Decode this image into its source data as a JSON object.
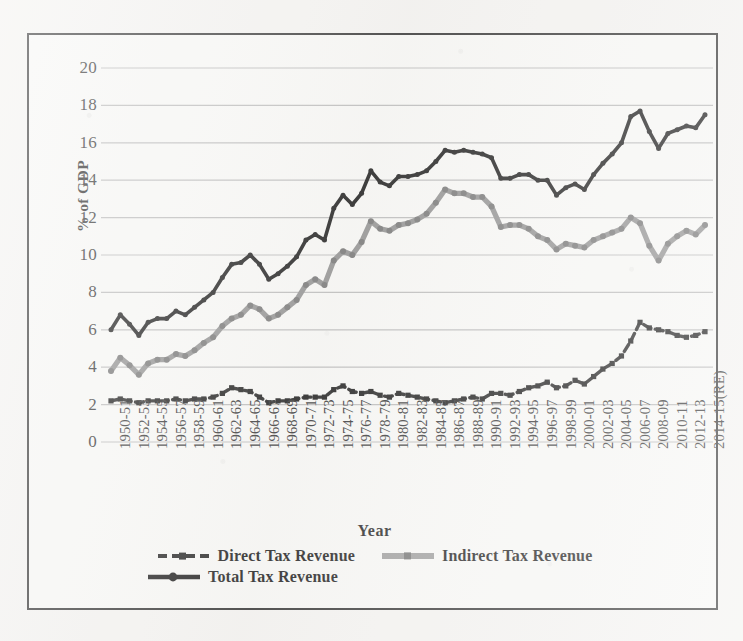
{
  "figure": {
    "yaxis_title": "% of GDP",
    "xaxis_title": "Year",
    "frame_border_color": "#2b2b2b",
    "background_color": "#f4f3f1"
  },
  "legend": {
    "items": [
      {
        "label": "Direct Tax Revenue",
        "color": "#1a1a1a",
        "style": "dashed-marker"
      },
      {
        "label": "Indirect Tax Revenue",
        "color": "#8c8c8c",
        "style": "solid-marker"
      },
      {
        "label": "Total Tax Revenue",
        "color": "#111111",
        "style": "solid-marker"
      }
    ]
  },
  "chart_data": {
    "type": "line",
    "title": "",
    "xlabel": "Year",
    "ylabel": "% of GDP",
    "ylim": [
      0,
      20
    ],
    "ytick_step": 2,
    "yticks": [
      0,
      2,
      4,
      6,
      8,
      10,
      12,
      14,
      16,
      18,
      20
    ],
    "grid": "horizontal",
    "legend_position": "bottom",
    "xtick_interval": 2,
    "x": [
      "1950-51",
      "1951-52",
      "1952-53",
      "1953-54",
      "1954-55",
      "1955-56",
      "1956-57",
      "1957-58",
      "1958-59",
      "1959-60",
      "1960-61",
      "1961-62",
      "1962-63",
      "1963-64",
      "1964-65",
      "1965-66",
      "1966-67",
      "1967-68",
      "1968-69",
      "1969-70",
      "1970-71",
      "1971-72",
      "1972-73",
      "1973-74",
      "1974-75",
      "1975-76",
      "1976-77",
      "1977-78",
      "1978-79",
      "1979-80",
      "1980-81",
      "1981-82",
      "1982-83",
      "1983-84",
      "1984-85",
      "1985-86",
      "1986-87",
      "1987-88",
      "1988-89",
      "1989-90",
      "1990-91",
      "1991-92",
      "1992-93",
      "1993-94",
      "1994-95",
      "1995-96",
      "1996-97",
      "1997-98",
      "1998-99",
      "1999-00",
      "2000-01",
      "2001-02",
      "2002-03",
      "2003-04",
      "2004-05",
      "2005-06",
      "2006-07",
      "2007-08",
      "2008-09",
      "2009-10",
      "2010-11",
      "2011-12",
      "2012-13",
      "2013-14",
      "2014-15(RE)"
    ],
    "xticks_shown": [
      "1950-51",
      "1952-53",
      "1954-55",
      "1956-57",
      "1958-59",
      "1960-61",
      "1962-63",
      "1964-65",
      "1966-67",
      "1968-69",
      "1970-71",
      "1972-73",
      "1974-75",
      "1976-77",
      "1978-79",
      "1980-81",
      "1982-83",
      "1984-85",
      "1986-87",
      "1988-89",
      "1990-91",
      "1992-93",
      "1994-95",
      "1996-97",
      "1998-99",
      "2000-01",
      "2002-03",
      "2004-05",
      "2006-07",
      "2008-09",
      "2010-11",
      "2012-13",
      "2014-15(RE)"
    ],
    "series": [
      {
        "name": "Direct Tax Revenue",
        "color": "#1a1a1a",
        "values": [
          2.2,
          2.3,
          2.2,
          2.1,
          2.2,
          2.2,
          2.2,
          2.3,
          2.2,
          2.3,
          2.3,
          2.4,
          2.6,
          2.9,
          2.8,
          2.7,
          2.4,
          2.1,
          2.2,
          2.2,
          2.3,
          2.4,
          2.4,
          2.4,
          2.8,
          3.0,
          2.7,
          2.6,
          2.7,
          2.5,
          2.4,
          2.6,
          2.5,
          2.4,
          2.3,
          2.2,
          2.1,
          2.2,
          2.3,
          2.4,
          2.3,
          2.6,
          2.6,
          2.5,
          2.7,
          2.9,
          3.0,
          3.2,
          2.9,
          3.0,
          3.3,
          3.1,
          3.5,
          3.9,
          4.2,
          4.6,
          5.4,
          6.4,
          6.1,
          6.0,
          5.9,
          5.7,
          5.6,
          5.7,
          5.9
        ]
      },
      {
        "name": "Indirect Tax Revenue",
        "color": "#8c8c8c",
        "values": [
          3.8,
          4.5,
          4.1,
          3.6,
          4.2,
          4.4,
          4.4,
          4.7,
          4.6,
          4.9,
          5.3,
          5.6,
          6.2,
          6.6,
          6.8,
          7.3,
          7.1,
          6.6,
          6.8,
          7.2,
          7.6,
          8.4,
          8.7,
          8.4,
          9.7,
          10.2,
          10.0,
          10.7,
          11.8,
          11.4,
          11.3,
          11.6,
          11.7,
          11.9,
          12.2,
          12.8,
          13.5,
          13.3,
          13.3,
          13.1,
          13.1,
          12.6,
          11.5,
          11.6,
          11.6,
          11.4,
          11.0,
          10.8,
          10.3,
          10.6,
          10.5,
          10.4,
          10.8,
          11.0,
          11.2,
          11.4,
          12.0,
          11.7,
          10.5,
          9.7,
          10.6,
          11.0,
          11.3,
          11.1,
          11.6
        ]
      },
      {
        "name": "Total Tax Revenue",
        "color": "#111111",
        "values": [
          6.0,
          6.8,
          6.3,
          5.7,
          6.4,
          6.6,
          6.6,
          7.0,
          6.8,
          7.2,
          7.6,
          8.0,
          8.8,
          9.5,
          9.6,
          10.0,
          9.5,
          8.7,
          9.0,
          9.4,
          9.9,
          10.8,
          11.1,
          10.8,
          12.5,
          13.2,
          12.7,
          13.3,
          14.5,
          13.9,
          13.7,
          14.2,
          14.2,
          14.3,
          14.5,
          15.0,
          15.6,
          15.5,
          15.6,
          15.5,
          15.4,
          15.2,
          14.1,
          14.1,
          14.3,
          14.3,
          14.0,
          14.0,
          13.2,
          13.6,
          13.8,
          13.5,
          14.3,
          14.9,
          15.4,
          16.0,
          17.4,
          17.7,
          16.6,
          15.7,
          16.5,
          16.7,
          16.9,
          16.8,
          17.5
        ]
      }
    ]
  }
}
